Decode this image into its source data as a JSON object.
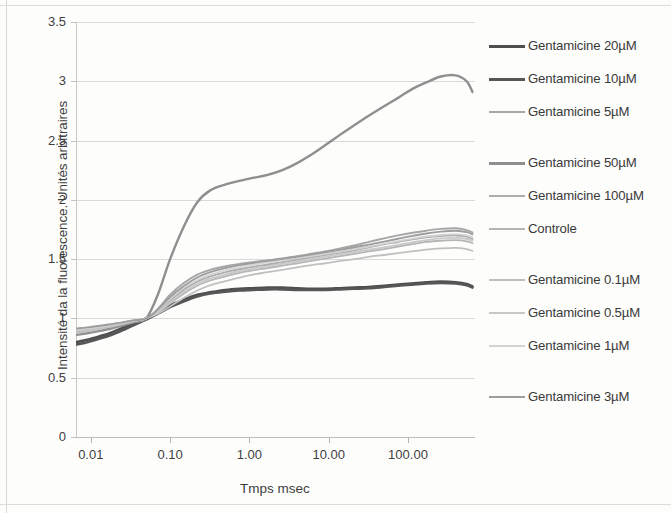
{
  "chart_data": {
    "type": "line",
    "title": "",
    "xlabel": "Tmps msec",
    "ylabel": "Intensité da la fluorescence. Unités arbitraires",
    "xscale": "log",
    "xlim": [
      0.0065,
      700
    ],
    "ylim": [
      0,
      3.5
    ],
    "grid": true,
    "legend_position": "right",
    "x_ticks": [
      "0.01",
      "0.10",
      "1.00",
      "10.00",
      "100.00"
    ],
    "x_tick_values": [
      0.01,
      0.1,
      1,
      10,
      100
    ],
    "y_ticks": [
      "0",
      "0.5",
      "1",
      "1.5",
      "2",
      "2.5",
      "3",
      "3.5"
    ],
    "y_tick_values": [
      0,
      0.5,
      1,
      1.5,
      2,
      2.5,
      3,
      3.5
    ],
    "series": [
      {
        "name": "Gentamicine 20µM",
        "color": "#4f4f4f",
        "width": 2.6,
        "x": [
          0.0065,
          0.009,
          0.013,
          0.018,
          0.025,
          0.035,
          0.05,
          0.07,
          0.1,
          0.15,
          0.22,
          0.32,
          0.5,
          0.75,
          1.1,
          1.7,
          2.6,
          4,
          6,
          9,
          14,
          21,
          32,
          50,
          75,
          110,
          170,
          260,
          400,
          550,
          650
        ],
        "values": [
          0.8,
          0.82,
          0.85,
          0.88,
          0.92,
          0.96,
          1.0,
          1.05,
          1.11,
          1.16,
          1.2,
          1.22,
          1.24,
          1.25,
          1.255,
          1.26,
          1.26,
          1.255,
          1.25,
          1.25,
          1.255,
          1.26,
          1.265,
          1.275,
          1.285,
          1.295,
          1.305,
          1.31,
          1.305,
          1.29,
          1.27
        ]
      },
      {
        "name": "Gentamicine 10µM",
        "color": "#565656",
        "width": 2.6,
        "x": [
          0.0065,
          0.009,
          0.013,
          0.018,
          0.025,
          0.035,
          0.05,
          0.07,
          0.1,
          0.15,
          0.22,
          0.32,
          0.5,
          0.75,
          1.1,
          1.7,
          2.6,
          4,
          6,
          9,
          14,
          21,
          32,
          50,
          75,
          110,
          170,
          260,
          400,
          550,
          650
        ],
        "values": [
          0.78,
          0.8,
          0.83,
          0.86,
          0.9,
          0.945,
          0.99,
          1.04,
          1.095,
          1.145,
          1.185,
          1.21,
          1.225,
          1.235,
          1.24,
          1.245,
          1.245,
          1.24,
          1.24,
          1.24,
          1.245,
          1.25,
          1.255,
          1.265,
          1.275,
          1.285,
          1.295,
          1.3,
          1.295,
          1.28,
          1.26
        ]
      },
      {
        "name": "Gentamicine 5µM",
        "color": "#a6a6a6",
        "width": 1.9,
        "x": [
          0.0065,
          0.009,
          0.013,
          0.018,
          0.025,
          0.035,
          0.05,
          0.07,
          0.1,
          0.15,
          0.22,
          0.32,
          0.5,
          0.75,
          1.1,
          1.7,
          2.6,
          4,
          6,
          9,
          14,
          21,
          32,
          50,
          75,
          110,
          170,
          260,
          400,
          550,
          650
        ],
        "values": [
          0.9,
          0.915,
          0.93,
          0.95,
          0.965,
          0.985,
          1.0,
          1.08,
          1.2,
          1.3,
          1.37,
          1.41,
          1.44,
          1.46,
          1.475,
          1.49,
          1.505,
          1.525,
          1.545,
          1.565,
          1.59,
          1.615,
          1.645,
          1.675,
          1.7,
          1.72,
          1.74,
          1.755,
          1.76,
          1.745,
          1.725
        ]
      },
      {
        "name": "Gentamicine 50µM",
        "color": "#8f8f8f",
        "width": 2.4,
        "x": [
          0.0065,
          0.009,
          0.013,
          0.018,
          0.025,
          0.035,
          0.05,
          0.07,
          0.1,
          0.15,
          0.22,
          0.32,
          0.5,
          0.75,
          1.1,
          1.7,
          2.6,
          4,
          6,
          9,
          14,
          21,
          32,
          50,
          75,
          110,
          170,
          260,
          400,
          550,
          650
        ],
        "values": [
          0.86,
          0.875,
          0.895,
          0.915,
          0.94,
          0.97,
          1.0,
          1.2,
          1.5,
          1.78,
          1.98,
          2.08,
          2.13,
          2.16,
          2.185,
          2.21,
          2.25,
          2.31,
          2.38,
          2.46,
          2.55,
          2.63,
          2.71,
          2.79,
          2.86,
          2.93,
          2.99,
          3.04,
          3.05,
          3.0,
          2.91
        ]
      },
      {
        "name": "Gentamicine 100µM",
        "color": "#adadad",
        "width": 1.9,
        "x": [
          0.0065,
          0.009,
          0.013,
          0.018,
          0.025,
          0.035,
          0.05,
          0.07,
          0.1,
          0.15,
          0.22,
          0.32,
          0.5,
          0.75,
          1.1,
          1.7,
          2.6,
          4,
          6,
          9,
          14,
          21,
          32,
          50,
          75,
          110,
          170,
          260,
          400,
          550,
          650
        ],
        "values": [
          0.88,
          0.895,
          0.915,
          0.935,
          0.955,
          0.98,
          1.0,
          1.06,
          1.15,
          1.245,
          1.31,
          1.355,
          1.39,
          1.415,
          1.435,
          1.455,
          1.475,
          1.495,
          1.515,
          1.535,
          1.555,
          1.575,
          1.6,
          1.625,
          1.645,
          1.665,
          1.685,
          1.695,
          1.7,
          1.69,
          1.67
        ]
      },
      {
        "name": "Controle",
        "color": "#b5b5b5",
        "width": 1.8,
        "x": [
          0.0065,
          0.009,
          0.013,
          0.018,
          0.025,
          0.035,
          0.05,
          0.07,
          0.1,
          0.15,
          0.22,
          0.32,
          0.5,
          0.75,
          1.1,
          1.7,
          2.6,
          4,
          6,
          9,
          14,
          21,
          32,
          50,
          75,
          110,
          170,
          260,
          400,
          550,
          650
        ],
        "values": [
          0.885,
          0.9,
          0.915,
          0.935,
          0.955,
          0.978,
          1.0,
          1.05,
          1.125,
          1.21,
          1.275,
          1.32,
          1.355,
          1.385,
          1.405,
          1.425,
          1.445,
          1.465,
          1.485,
          1.505,
          1.525,
          1.545,
          1.565,
          1.585,
          1.605,
          1.625,
          1.645,
          1.655,
          1.66,
          1.65,
          1.635
        ]
      },
      {
        "name": "Gentamicine 0.1µM",
        "color": "#c0c0c0",
        "width": 1.8,
        "x": [
          0.0065,
          0.009,
          0.013,
          0.018,
          0.025,
          0.035,
          0.05,
          0.07,
          0.1,
          0.15,
          0.22,
          0.32,
          0.5,
          0.75,
          1.1,
          1.7,
          2.6,
          4,
          6,
          9,
          14,
          21,
          32,
          50,
          75,
          110,
          170,
          260,
          400,
          550,
          650
        ],
        "values": [
          0.875,
          0.89,
          0.91,
          0.93,
          0.952,
          0.976,
          1.0,
          1.04,
          1.1,
          1.175,
          1.235,
          1.28,
          1.315,
          1.345,
          1.37,
          1.39,
          1.41,
          1.43,
          1.45,
          1.465,
          1.485,
          1.5,
          1.52,
          1.535,
          1.55,
          1.565,
          1.58,
          1.59,
          1.595,
          1.585,
          1.57
        ]
      },
      {
        "name": "Gentamicine 0.5µM",
        "color": "#c8c8c8",
        "width": 1.8,
        "x": [
          0.0065,
          0.009,
          0.013,
          0.018,
          0.025,
          0.035,
          0.05,
          0.07,
          0.1,
          0.15,
          0.22,
          0.32,
          0.5,
          0.75,
          1.1,
          1.7,
          2.6,
          4,
          6,
          9,
          14,
          21,
          32,
          50,
          75,
          110,
          170,
          260,
          400,
          550,
          650
        ],
        "values": [
          0.895,
          0.908,
          0.922,
          0.94,
          0.958,
          0.979,
          1.0,
          1.055,
          1.135,
          1.225,
          1.29,
          1.335,
          1.37,
          1.4,
          1.42,
          1.44,
          1.46,
          1.48,
          1.5,
          1.52,
          1.54,
          1.56,
          1.58,
          1.6,
          1.62,
          1.64,
          1.66,
          1.675,
          1.68,
          1.67,
          1.655
        ]
      },
      {
        "name": "Gentamicine 1µM",
        "color": "#d4d4d4",
        "width": 1.7,
        "x": [
          0.0065,
          0.009,
          0.013,
          0.018,
          0.025,
          0.035,
          0.05,
          0.07,
          0.1,
          0.15,
          0.22,
          0.32,
          0.5,
          0.75,
          1.1,
          1.7,
          2.6,
          4,
          6,
          9,
          14,
          21,
          32,
          50,
          75,
          110,
          170,
          260,
          400,
          550,
          650
        ],
        "values": [
          0.905,
          0.917,
          0.93,
          0.947,
          0.963,
          0.982,
          1.0,
          1.07,
          1.165,
          1.26,
          1.325,
          1.37,
          1.405,
          1.432,
          1.452,
          1.472,
          1.49,
          1.508,
          1.526,
          1.544,
          1.564,
          1.584,
          1.606,
          1.63,
          1.652,
          1.672,
          1.692,
          1.705,
          1.712,
          1.7,
          1.685
        ]
      },
      {
        "name": "Gentamicine 3µM",
        "color": "#9d9d9d",
        "width": 1.9,
        "x": [
          0.0065,
          0.009,
          0.013,
          0.018,
          0.025,
          0.035,
          0.05,
          0.07,
          0.1,
          0.15,
          0.22,
          0.32,
          0.5,
          0.75,
          1.1,
          1.7,
          2.6,
          4,
          6,
          9,
          14,
          21,
          32,
          50,
          75,
          110,
          170,
          260,
          400,
          550,
          650
        ],
        "values": [
          0.915,
          0.925,
          0.938,
          0.952,
          0.967,
          0.984,
          1.0,
          1.075,
          1.18,
          1.275,
          1.345,
          1.39,
          1.425,
          1.45,
          1.468,
          1.486,
          1.502,
          1.52,
          1.538,
          1.558,
          1.578,
          1.6,
          1.622,
          1.648,
          1.672,
          1.694,
          1.716,
          1.732,
          1.74,
          1.728,
          1.71
        ]
      }
    ]
  },
  "legend": {
    "entries": [
      {
        "label": "Gentamicine 20µM",
        "color": "#4f4f4f",
        "thickness": 3,
        "top": 38
      },
      {
        "label": "Gentamicine 10µM",
        "color": "#565656",
        "thickness": 3,
        "top": 71
      },
      {
        "label": "Gentamicine 5µM",
        "color": "#a6a6a6",
        "thickness": 2,
        "top": 104
      },
      {
        "label": "Gentamicine 50µM",
        "color": "#8f8f8f",
        "thickness": 3,
        "top": 155
      },
      {
        "label": "Gentamicine 100µM",
        "color": "#adadad",
        "thickness": 2,
        "top": 188
      },
      {
        "label": "Controle",
        "color": "#b5b5b5",
        "thickness": 2,
        "top": 221
      },
      {
        "label": "Gentamicine 0.1µM",
        "color": "#c0c0c0",
        "thickness": 2,
        "top": 272
      },
      {
        "label": "Gentamicine 0.5µM",
        "color": "#c8c8c8",
        "thickness": 2,
        "top": 305
      },
      {
        "label": "Gentamicine 1µM",
        "color": "#d4d4d4",
        "thickness": 2,
        "top": 338
      },
      {
        "label": "Gentamicine 3µM",
        "color": "#9d9d9d",
        "thickness": 2,
        "top": 389
      }
    ]
  }
}
